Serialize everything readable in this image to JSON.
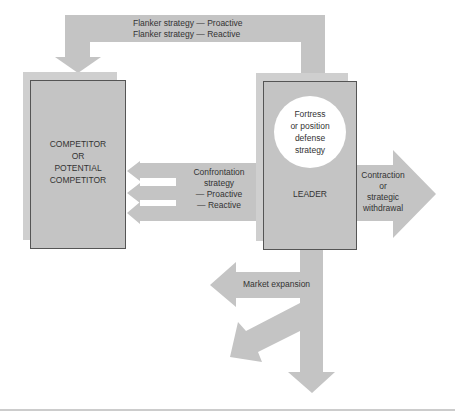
{
  "colors": {
    "shape_fill": "#c4c4c4",
    "box_border": "#555555",
    "text": "#333333",
    "circle_fill": "#ffffff",
    "rule": "#999999"
  },
  "flanker": {
    "line1": "Flanker strategy — Proactive",
    "line2": "Flanker strategy — Reactive"
  },
  "competitor": {
    "line1": "COMPETITOR",
    "line2": "OR",
    "line3": "POTENTIAL",
    "line4": "COMPETITOR"
  },
  "confrontation": {
    "line1": "Confrontation",
    "line2": "strategy",
    "line3": "— Proactive",
    "line4": "— Reactive"
  },
  "leader": {
    "label": "LEADER",
    "fortress": {
      "line1": "Fortress",
      "line2": "or position",
      "line3": "defense",
      "line4": "strategy"
    }
  },
  "contraction": {
    "line1": "Contraction",
    "line2": "or",
    "line3": "strategic",
    "line4": "withdrawal"
  },
  "market_expansion": {
    "label": "Market expansion"
  }
}
